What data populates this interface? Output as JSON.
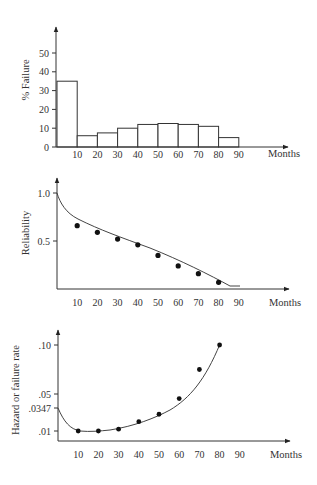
{
  "chart_data": [
    {
      "type": "bar",
      "title": "",
      "xlabel": "Months",
      "ylabel": "% Failure",
      "x_ticks": [
        "10",
        "20",
        "30",
        "40",
        "50",
        "60",
        "70",
        "80",
        "90"
      ],
      "y_ticks": [
        "0",
        "10",
        "20",
        "30",
        "40",
        "50"
      ],
      "ylim": [
        0,
        55
      ],
      "bins": [
        [
          0,
          10
        ],
        [
          10,
          20
        ],
        [
          20,
          30
        ],
        [
          30,
          40
        ],
        [
          40,
          50
        ],
        [
          50,
          60
        ],
        [
          60,
          70
        ],
        [
          70,
          80
        ],
        [
          80,
          90
        ]
      ],
      "values": [
        35,
        6,
        7.5,
        10,
        12,
        12.5,
        12,
        11,
        5
      ]
    },
    {
      "type": "scatter",
      "title": "",
      "xlabel": "Months",
      "ylabel": "Reliability",
      "x_ticks": [
        "10",
        "20",
        "30",
        "40",
        "50",
        "60",
        "70",
        "80",
        "90"
      ],
      "y_ticks": [
        "0.5",
        "1.0"
      ],
      "ylim": [
        0,
        1.1
      ],
      "x": [
        10,
        20,
        30,
        40,
        50,
        60,
        70,
        80
      ],
      "values": [
        0.66,
        0.59,
        0.52,
        0.46,
        0.35,
        0.24,
        0.16,
        0.07
      ],
      "fitted_curve": "smooth decreasing curve from 1.0 at 0 months to ~0.05 at ~90 months"
    },
    {
      "type": "scatter",
      "title": "",
      "xlabel": "Months",
      "ylabel": "Hazard or failure rate",
      "x_ticks": [
        "10",
        "20",
        "30",
        "40",
        "50",
        "60",
        "70",
        "80",
        "90"
      ],
      "y_ticks": [
        ".01",
        ".0347",
        ".05",
        ".10"
      ],
      "x": [
        10,
        20,
        30,
        40,
        50,
        60,
        70,
        80
      ],
      "values": [
        0.01,
        0.01,
        0.012,
        0.02,
        0.028,
        0.045,
        0.075,
        0.1
      ],
      "fitted_curve": "bathtub-like curve starting at .0347 at 0 months, minimum ~.01 near 15-20 months, rising to ~.10 at 80 months"
    }
  ],
  "labels": {
    "months": "Months",
    "pct_failure": "% Failure",
    "reliability": "Reliability",
    "hazard": "Hazard or failure rate"
  }
}
